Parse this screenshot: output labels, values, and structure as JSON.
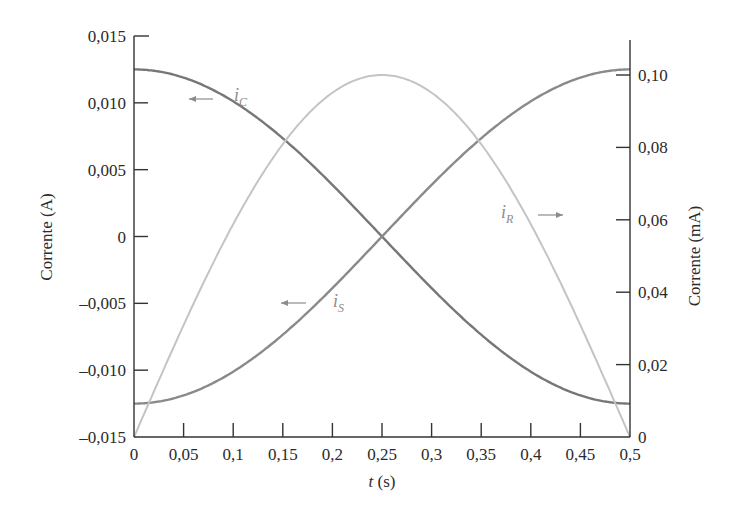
{
  "chart_data": {
    "type": "line",
    "title": "",
    "xlabel_var": "t",
    "xlabel_unit": " (s)",
    "ylabel_left": "Corrente (A)",
    "ylabel_right": "Corrente (mA)",
    "xlim": [
      0,
      0.5
    ],
    "ylim_left": [
      -0.015,
      0.015
    ],
    "ylim_right": [
      0,
      0.1
    ],
    "grid": false,
    "x_ticks": [
      "0",
      "0,05",
      "0,1",
      "0,15",
      "0,2",
      "0,25",
      "0,3",
      "0,35",
      "0,4",
      "0,45",
      "0,5"
    ],
    "y_left_ticks": [
      "0,015",
      "0,010",
      "0,005",
      "0",
      "–0,005",
      "–0,010",
      "–0,015"
    ],
    "y_right_ticks": [
      "0,10",
      "0,08",
      "0,06",
      "0,04",
      "0,02",
      "0"
    ],
    "x": [
      0,
      0.05,
      0.1,
      0.15,
      0.2,
      0.25,
      0.3,
      0.35,
      0.4,
      0.45,
      0.5
    ],
    "series": [
      {
        "name": "iC",
        "label_main": "i",
        "label_sub": "C",
        "axis": "left",
        "color": "#777777",
        "values": [
          0.0125,
          0.0119,
          0.0101,
          0.0073,
          0.0039,
          0.0,
          -0.0039,
          -0.0073,
          -0.0101,
          -0.0119,
          -0.0125
        ]
      },
      {
        "name": "iS",
        "label_main": "i",
        "label_sub": "S",
        "axis": "left",
        "color": "#8a8a8a",
        "values": [
          -0.0125,
          -0.0119,
          -0.0101,
          -0.0073,
          -0.0039,
          0.0,
          0.0039,
          0.0073,
          0.0101,
          0.0119,
          0.0125
        ]
      },
      {
        "name": "iR",
        "label_main": "i",
        "label_sub": "R",
        "axis": "right",
        "color": "#c4c4c4",
        "values": [
          0.0,
          0.0309,
          0.0588,
          0.0809,
          0.0951,
          0.1,
          0.0951,
          0.0809,
          0.0588,
          0.0309,
          0.0
        ]
      }
    ],
    "annotations": [
      {
        "text": "iC",
        "arrow": "left",
        "meaning": "left axis"
      },
      {
        "text": "iS",
        "arrow": "left",
        "meaning": "left axis"
      },
      {
        "text": "iR",
        "arrow": "right",
        "meaning": "right axis"
      }
    ]
  }
}
